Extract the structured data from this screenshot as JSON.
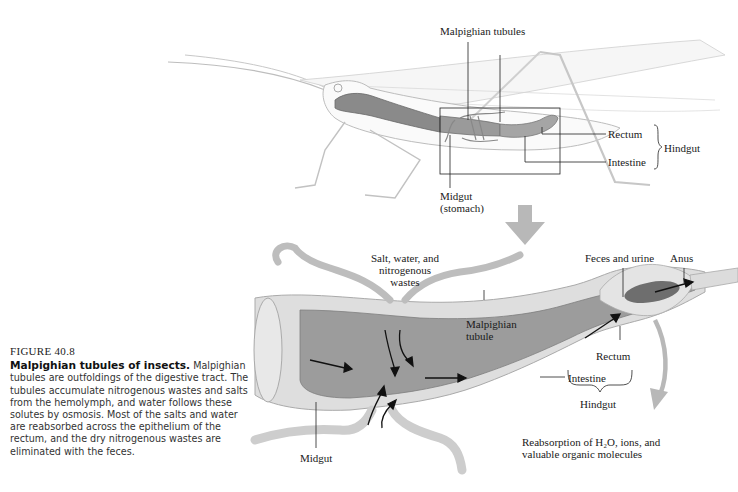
{
  "figure": {
    "number": "FIGURE 40.8",
    "title": "Malpighian tubules of insects.",
    "caption": " Malpighian tubules are outfoldings of the digestive tract. The tubules accumulate nitrogenous wastes and salts from the hemolymph, and water follows these solutes by osmosis. Most of the salts and water are reabsorbed across the epithelium of the rectum, and the dry nitrogenous wastes are eliminated with the feces."
  },
  "upper_diagram": {
    "subject": "grasshopper",
    "labels": {
      "malpighian_tubules": "Malpighian tubules",
      "rectum": "Rectum",
      "intestine": "Intestine",
      "hindgut": "Hindgut",
      "midgut_line1": "Midgut",
      "midgut_line2": "(stomach)"
    }
  },
  "lower_diagram": {
    "labels": {
      "salt_water_line1": "Salt, water, and",
      "salt_water_line2": "nitrogenous",
      "salt_water_line3": "wastes",
      "malpighian_tubule_line1": "Malpighian",
      "malpighian_tubule_line2": "tubule",
      "feces_urine": "Feces and urine",
      "anus": "Anus",
      "rectum": "Rectum",
      "intestine": "Intestine",
      "hindgut": "Hindgut",
      "midgut": "Midgut",
      "reabsorption_line1": "Reabsorption of  H₂O, ions, and",
      "reabsorption_line2": "valuable organic molecules"
    }
  },
  "colors": {
    "gut_dark": "#7a7a7a",
    "gut_mid": "#a8a8a8",
    "tissue_light": "#d9d9d9",
    "arrow_gray": "#b5b5b5",
    "outline": "#222222"
  }
}
